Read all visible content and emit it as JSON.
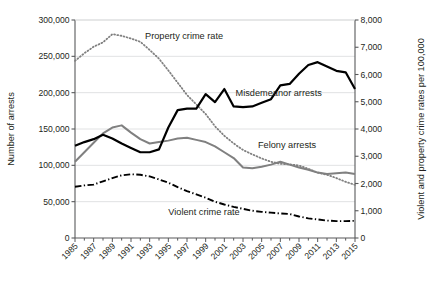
{
  "chart_data": {
    "type": "line",
    "title": "",
    "subtitle": "",
    "xlabel": "",
    "ylabel": "Number of arrests",
    "y2label": "Violent and property crime rates per 100,000",
    "ylim": [
      0,
      300000
    ],
    "y2lim": [
      0,
      8000
    ],
    "ytick_labels": [
      "0",
      "50,000",
      "100,000",
      "150,000",
      "200,000",
      "250,000",
      "300,000"
    ],
    "ytick_values": [
      0,
      50000,
      100000,
      150000,
      200000,
      250000,
      300000
    ],
    "y2tick_labels": [
      "0",
      "1,000",
      "2,000",
      "3,000",
      "4,000",
      "5,000",
      "6,000",
      "7,000",
      "8,000"
    ],
    "y2tick_values": [
      0,
      1000,
      2000,
      3000,
      4000,
      5000,
      6000,
      7000,
      8000
    ],
    "grid": "horizontal-light",
    "legend_position": "inline-annotations",
    "xlim": [
      1985,
      2015
    ],
    "x": [
      1985,
      1986,
      1987,
      1988,
      1989,
      1990,
      1991,
      1992,
      1993,
      1994,
      1995,
      1996,
      1997,
      1998,
      1999,
      2000,
      2001,
      2002,
      2003,
      2004,
      2005,
      2006,
      2007,
      2008,
      2009,
      2010,
      2011,
      2012,
      2013,
      2014,
      2015
    ],
    "xtick_labels": [
      "1985",
      "1987",
      "1989",
      "1991",
      "1993",
      "1995",
      "1997",
      "1999",
      "2001",
      "2003",
      "2005",
      "2007",
      "2009",
      "2011",
      "2013",
      "2015"
    ],
    "xtick_values": [
      1985,
      1987,
      1989,
      1991,
      1993,
      1995,
      1997,
      1999,
      2001,
      2003,
      2005,
      2007,
      2009,
      2011,
      2013,
      2015
    ],
    "xtick_minor_every": 1,
    "series": [
      {
        "name": "Misdemeanor arrests",
        "axis": "left",
        "style": "solid",
        "color": "#000000",
        "width": 2.2,
        "label_x": 2002.2,
        "label_y": 196000,
        "values": [
          127000,
          132000,
          136000,
          142000,
          137000,
          130000,
          124000,
          118000,
          118000,
          122000,
          152000,
          176000,
          178000,
          178000,
          198000,
          187000,
          205000,
          181000,
          180000,
          181000,
          186000,
          191000,
          210000,
          212000,
          226000,
          238000,
          242000,
          236000,
          230000,
          228000,
          205000
        ]
      },
      {
        "name": "Felony arrests",
        "axis": "left",
        "style": "solid",
        "color": "#808080",
        "width": 2.0,
        "label_x": 2004.6,
        "label_y": 124000,
        "values": [
          105000,
          118000,
          131000,
          144000,
          152000,
          155000,
          145000,
          136000,
          130000,
          132000,
          134000,
          137000,
          138000,
          135000,
          132000,
          126000,
          118000,
          110000,
          97000,
          96000,
          98000,
          101000,
          105000,
          101000,
          97000,
          94000,
          90000,
          88000,
          89000,
          90000,
          88000
        ]
      },
      {
        "name": "Property crime rate",
        "axis": "right",
        "style": "dotted",
        "color": "#808080",
        "width": 1.8,
        "label_x": 1992.5,
        "label_y_right": 7300,
        "values": [
          6500,
          6780,
          7020,
          7180,
          7480,
          7420,
          7320,
          7200,
          6900,
          6580,
          6150,
          5700,
          5250,
          4900,
          4550,
          4100,
          3750,
          3470,
          3230,
          3070,
          2920,
          2800,
          2720,
          2700,
          2660,
          2540,
          2400,
          2320,
          2200,
          2060,
          1950
        ]
      },
      {
        "name": "Violent crime rate",
        "axis": "right",
        "style": "dash-dot",
        "color": "#000000",
        "width": 1.9,
        "label_x": 1995.0,
        "label_y_right": 830,
        "values": [
          1880,
          1930,
          1960,
          2080,
          2200,
          2300,
          2340,
          2320,
          2260,
          2150,
          2030,
          1870,
          1720,
          1600,
          1480,
          1330,
          1230,
          1140,
          1070,
          1000,
          960,
          930,
          900,
          880,
          790,
          720,
          680,
          640,
          620,
          620,
          630
        ]
      }
    ],
    "annotations": [
      {
        "text": "Property crime rate",
        "ref": "series.2"
      },
      {
        "text": "Misdemeanor arrests",
        "ref": "series.0"
      },
      {
        "text": "Felony arrests",
        "ref": "series.1"
      },
      {
        "text": "Violent crime rate",
        "ref": "series.3"
      }
    ]
  },
  "colors": {
    "axis": "#58595b",
    "grid": "#d9dbdc",
    "text": "#231f20",
    "gray_series": "#808080",
    "black_series": "#000000",
    "background": "#ffffff"
  }
}
